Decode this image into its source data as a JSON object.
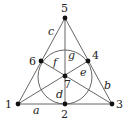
{
  "diagram": {
    "points": [
      {
        "id": "1",
        "label": "1",
        "x": 18,
        "y": 104
      },
      {
        "id": "2",
        "label": "2",
        "x": 65,
        "y": 104
      },
      {
        "id": "3",
        "label": "3",
        "x": 112,
        "y": 104
      },
      {
        "id": "4",
        "label": "4",
        "x": 88,
        "y": 61
      },
      {
        "id": "5",
        "label": "5",
        "x": 65,
        "y": 18
      },
      {
        "id": "6",
        "label": "6",
        "x": 41,
        "y": 61
      },
      {
        "id": "7",
        "label": "7",
        "x": 65,
        "y": 76
      }
    ],
    "lines": [
      {
        "label": "a",
        "points": [
          "1",
          "2",
          "3"
        ]
      },
      {
        "label": "b",
        "points": [
          "3",
          "4",
          "5"
        ]
      },
      {
        "label": "c",
        "points": [
          "5",
          "6",
          "1"
        ]
      },
      {
        "label": "d",
        "points": [
          "5",
          "7",
          "2"
        ]
      },
      {
        "label": "e",
        "points": [
          "6",
          "7",
          "3"
        ]
      },
      {
        "label": "f",
        "points": [
          "4",
          "7",
          "1"
        ]
      },
      {
        "label": "g",
        "points": [
          "2",
          "4",
          "6"
        ],
        "shape": "circle"
      }
    ]
  }
}
